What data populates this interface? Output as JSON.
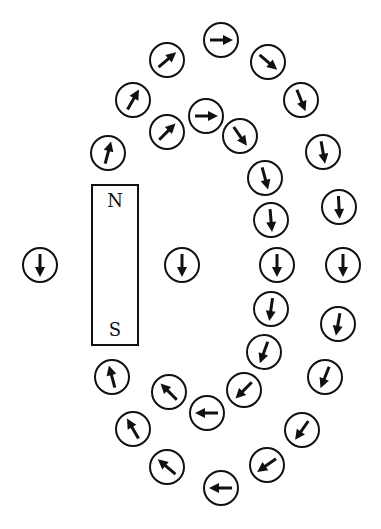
{
  "diagram": {
    "magnet": {
      "x": 91,
      "y": 184,
      "width": 48,
      "height": 162,
      "north_label": "N",
      "south_label": "S"
    },
    "compass_radius": 17,
    "compasses": [
      {
        "id": "outer-1",
        "x": 221,
        "y": 40,
        "angle": 0
      },
      {
        "id": "outer-2",
        "x": 268,
        "y": 62,
        "angle": 40
      },
      {
        "id": "outer-3",
        "x": 301,
        "y": 100,
        "angle": 68
      },
      {
        "id": "outer-4",
        "x": 323,
        "y": 152,
        "angle": 80
      },
      {
        "id": "outer-5",
        "x": 339,
        "y": 207,
        "angle": 87
      },
      {
        "id": "outer-6",
        "x": 343,
        "y": 265,
        "angle": 90
      },
      {
        "id": "outer-7",
        "x": 338,
        "y": 324,
        "angle": 100
      },
      {
        "id": "outer-8",
        "x": 325,
        "y": 377,
        "angle": 112
      },
      {
        "id": "outer-9",
        "x": 302,
        "y": 430,
        "angle": 125
      },
      {
        "id": "outer-10",
        "x": 267,
        "y": 465,
        "angle": 145
      },
      {
        "id": "outer-11",
        "x": 221,
        "y": 488,
        "angle": 180
      },
      {
        "id": "outer-12",
        "x": 167,
        "y": 467,
        "angle": 220
      },
      {
        "id": "outer-13",
        "x": 133,
        "y": 429,
        "angle": 240
      },
      {
        "id": "outer-14",
        "x": 112,
        "y": 377,
        "angle": 255
      },
      {
        "id": "outer-15",
        "x": 108,
        "y": 153,
        "angle": 285
      },
      {
        "id": "outer-16",
        "x": 133,
        "y": 100,
        "angle": 300
      },
      {
        "id": "outer-17",
        "x": 167,
        "y": 60,
        "angle": 320
      },
      {
        "id": "inner-1",
        "x": 206,
        "y": 116,
        "angle": 0
      },
      {
        "id": "inner-2",
        "x": 167,
        "y": 132,
        "angle": 315
      },
      {
        "id": "inner-3",
        "x": 240,
        "y": 136,
        "angle": 55
      },
      {
        "id": "inner-4",
        "x": 265,
        "y": 178,
        "angle": 75
      },
      {
        "id": "inner-5",
        "x": 271,
        "y": 220,
        "angle": 85
      },
      {
        "id": "inner-6",
        "x": 277,
        "y": 265,
        "angle": 90
      },
      {
        "id": "inner-7",
        "x": 271,
        "y": 309,
        "angle": 98
      },
      {
        "id": "inner-8",
        "x": 264,
        "y": 352,
        "angle": 110
      },
      {
        "id": "inner-9",
        "x": 244,
        "y": 390,
        "angle": 135
      },
      {
        "id": "inner-10",
        "x": 207,
        "y": 413,
        "angle": 180
      },
      {
        "id": "inner-11",
        "x": 169,
        "y": 392,
        "angle": 225
      },
      {
        "id": "center",
        "x": 182,
        "y": 265,
        "angle": 90
      },
      {
        "id": "left",
        "x": 40,
        "y": 265,
        "angle": 90
      }
    ],
    "colors": {
      "stroke": "#111111",
      "background": "#ffffff"
    }
  }
}
